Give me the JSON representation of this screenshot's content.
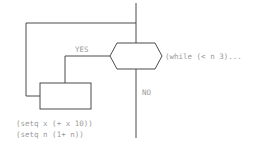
{
  "diagram": {
    "type": "flowchart",
    "decision": {
      "shape": "hexagon",
      "label": "(while (< n 3)..."
    },
    "branches": {
      "yes_label": "YES",
      "no_label": "NO"
    },
    "process": {
      "shape": "rectangle",
      "code_lines": [
        "(setq x (+ x 10))",
        "(setq n (1+ n))"
      ]
    },
    "colors": {
      "line": "#4a4a4a",
      "text": "#9a9a9a",
      "background": "#ffffff"
    }
  }
}
